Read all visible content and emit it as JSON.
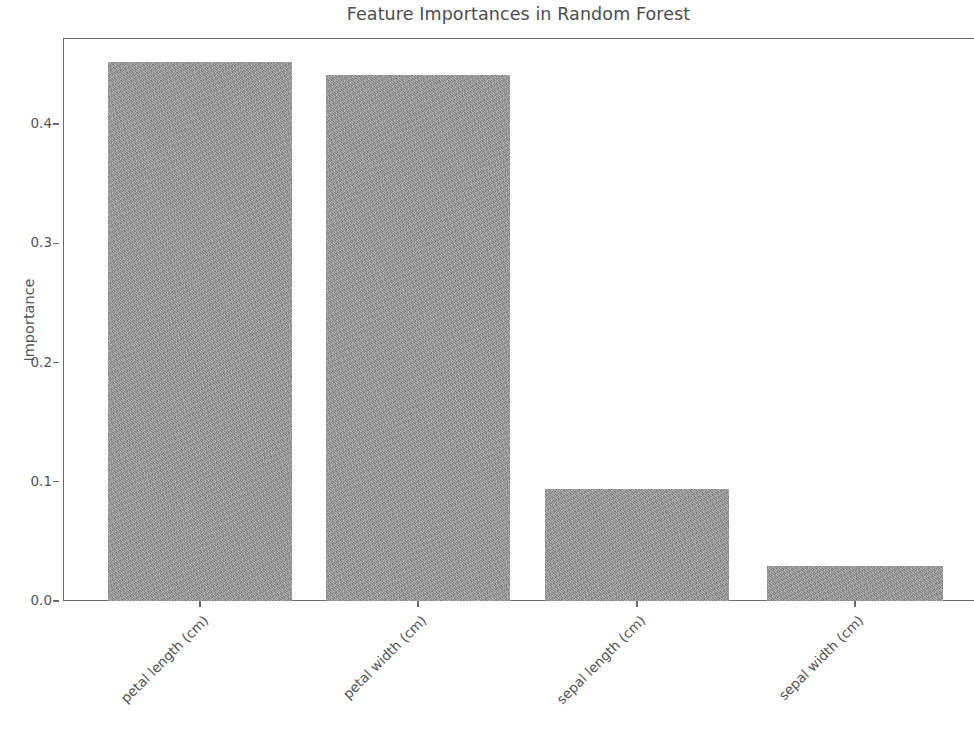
{
  "chart_data": {
    "type": "bar",
    "title": "Feature Importances in Random Forest",
    "xlabel": "",
    "ylabel": "Importance",
    "categories": [
      "petal length (cm)",
      "petal width (cm)",
      "sepal length (cm)",
      "sepal width (cm)"
    ],
    "values": [
      0.452,
      0.441,
      0.094,
      0.029
    ],
    "ylim": [
      0.0,
      0.472
    ],
    "yticks": [
      "0.0",
      "0.1",
      "0.2",
      "0.3",
      "0.4"
    ],
    "ytick_values": [
      0.0,
      0.1,
      0.2,
      0.3,
      0.4
    ],
    "grid": false,
    "legend": null,
    "bar_color": "#9b9b9b",
    "axis_color": "#6b6b6b",
    "text_color": "#555555",
    "xtick_rotation": -45
  }
}
